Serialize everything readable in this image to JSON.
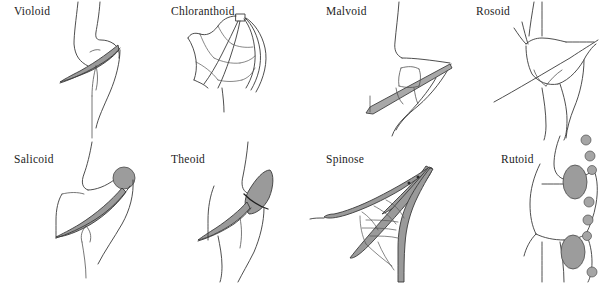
{
  "figure": {
    "background_color": "#ffffff",
    "width": 611,
    "height": 283,
    "line_color": "#3a3a3a",
    "shade_color": "#9a9a9a",
    "label_color": "#232323"
  },
  "panels": [
    {
      "id": "violoid",
      "label": "Violoid",
      "row": 0,
      "col": 0,
      "label_x": 14,
      "label_y": 10,
      "shading": "narrow elongate gray tooth wedge",
      "icon": "leaf-tooth-violoid-icon"
    },
    {
      "id": "chloranthoid",
      "label": "Chloranthoid",
      "row": 0,
      "col": 1,
      "label_x": 19,
      "label_y": 10,
      "shading": "none, open reticulate venation with small apical square",
      "icon": "leaf-tooth-chloranthoid-icon"
    },
    {
      "id": "malvoid",
      "label": "Malvoid",
      "row": 0,
      "col": 2,
      "label_x": 22,
      "label_y": 10,
      "shading": "long straight gray bar along tooth axis",
      "icon": "leaf-tooth-malvoid-icon"
    },
    {
      "id": "rosoid",
      "label": "Rosoid",
      "row": 0,
      "col": 3,
      "label_x": 20,
      "label_y": 10,
      "shading": "none, single long straight vein through tooth",
      "icon": "leaf-tooth-rosoid-icon"
    },
    {
      "id": "salicoid",
      "label": "Salicoid",
      "row": 1,
      "col": 0,
      "label_x": 14,
      "label_y": 16,
      "shading": "gray spherical apical gland with tapering gray vein",
      "icon": "leaf-tooth-salicoid-icon"
    },
    {
      "id": "theoid",
      "label": "Theoid",
      "row": 1,
      "col": 1,
      "label_x": 19,
      "label_y": 16,
      "shading": "gray lens-shaped apical body crossed by dark arc",
      "icon": "leaf-tooth-theoid-icon"
    },
    {
      "id": "spinose",
      "label": "Spinose",
      "row": 1,
      "col": 2,
      "label_x": 22,
      "label_y": 16,
      "shading": "converging gray bundles ending in a sharp spine tip",
      "icon": "leaf-tooth-spinose-icon"
    },
    {
      "id": "rutoid",
      "label": "Rutoid",
      "row": 1,
      "col": 3,
      "label_x": 45,
      "label_y": 16,
      "shading": "row of small gray marginal glands with two enlarged ellipses",
      "icon": "leaf-tooth-rutoid-icon"
    }
  ]
}
